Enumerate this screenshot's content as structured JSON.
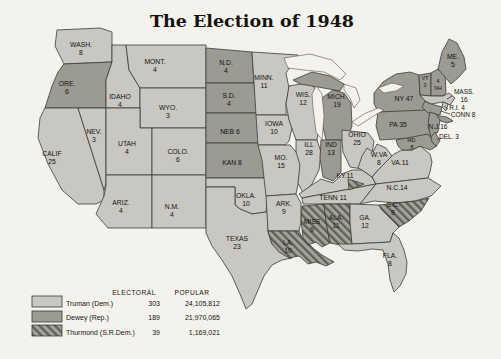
{
  "title": "The Election of 1948",
  "colors": {
    "truman": "#c8c7c1",
    "dewey": "#9b9a93",
    "thurmond_base": "#a3a29b",
    "thurmond_stripe": "#5f5e57",
    "border": "#3c3b35",
    "background": "#f4f2ec",
    "text": "#14130f"
  },
  "legend": {
    "electoral_header": "ELECTORAL",
    "popular_header": "POPULAR",
    "rows": [
      {
        "candidate": "Truman (Dem.)",
        "party": "truman",
        "electoral": "303",
        "popular": "24,105,812"
      },
      {
        "candidate": "Dewey (Rep.)",
        "party": "dewey",
        "electoral": "189",
        "popular": "21,970,065"
      },
      {
        "candidate": "Thurmond (S.R.Dem.)",
        "party": "thurmond",
        "electoral": "39",
        "popular": "1,169,021"
      }
    ]
  },
  "states": [
    {
      "id": "wash",
      "lines": [
        "WASH.",
        "8"
      ],
      "winner": "truman"
    },
    {
      "id": "ore",
      "lines": [
        "ORE.",
        "6"
      ],
      "winner": "dewey"
    },
    {
      "id": "calif",
      "lines": [
        "CALIF",
        "25"
      ],
      "winner": "truman"
    },
    {
      "id": "nev",
      "lines": [
        "NEV.",
        "3"
      ],
      "winner": "truman"
    },
    {
      "id": "idaho",
      "lines": [
        "IDAHO",
        "4"
      ],
      "winner": "truman"
    },
    {
      "id": "mont",
      "lines": [
        "MONT.",
        "4"
      ],
      "winner": "truman"
    },
    {
      "id": "wyo",
      "lines": [
        "WYO.",
        "3"
      ],
      "winner": "truman"
    },
    {
      "id": "utah",
      "lines": [
        "UTAH",
        "4"
      ],
      "winner": "truman"
    },
    {
      "id": "colo",
      "lines": [
        "COLO.",
        "6"
      ],
      "winner": "truman"
    },
    {
      "id": "ariz",
      "lines": [
        "ARIZ.",
        "4"
      ],
      "winner": "truman"
    },
    {
      "id": "nm",
      "lines": [
        "N.M.",
        "4"
      ],
      "winner": "truman"
    },
    {
      "id": "nd",
      "lines": [
        "N.D.",
        "4"
      ],
      "winner": "dewey"
    },
    {
      "id": "sd",
      "lines": [
        "S.D.",
        "4"
      ],
      "winner": "dewey"
    },
    {
      "id": "neb",
      "lines": [
        "NEB 6"
      ],
      "winner": "dewey"
    },
    {
      "id": "kan",
      "lines": [
        "KAN 8"
      ],
      "winner": "dewey"
    },
    {
      "id": "okla",
      "lines": [
        "OKLA.",
        "10"
      ],
      "winner": "truman"
    },
    {
      "id": "texas",
      "lines": [
        "TEXAS",
        "23"
      ],
      "winner": "truman"
    },
    {
      "id": "minn",
      "lines": [
        "MINN.",
        "11"
      ],
      "winner": "truman"
    },
    {
      "id": "iowa",
      "lines": [
        "IOWA",
        "10"
      ],
      "winner": "truman"
    },
    {
      "id": "mo",
      "lines": [
        "MO.",
        "15"
      ],
      "winner": "truman"
    },
    {
      "id": "ark",
      "lines": [
        "ARK.",
        "9"
      ],
      "winner": "truman"
    },
    {
      "id": "la",
      "lines": [
        "LA.",
        "10"
      ],
      "winner": "thurmond"
    },
    {
      "id": "wis",
      "lines": [
        "WIS.",
        "12"
      ],
      "winner": "truman"
    },
    {
      "id": "ill",
      "lines": [
        "ILL",
        "28"
      ],
      "winner": "truman"
    },
    {
      "id": "mich",
      "lines": [
        "MICH.",
        "19"
      ],
      "winner": "dewey"
    },
    {
      "id": "ind",
      "lines": [
        "IND",
        "13"
      ],
      "winner": "dewey"
    },
    {
      "id": "ohio",
      "lines": [
        "OHIO",
        "25"
      ],
      "winner": "truman"
    },
    {
      "id": "ky",
      "lines": [
        "KY.11"
      ],
      "winner": "truman"
    },
    {
      "id": "tenn",
      "lines": [
        "TENN 11"
      ],
      "winner": "truman"
    },
    {
      "id": "miss",
      "lines": [
        "MISS",
        "9"
      ],
      "winner": "thurmond"
    },
    {
      "id": "ala",
      "lines": [
        "ALA.",
        "11"
      ],
      "winner": "thurmond"
    },
    {
      "id": "ga",
      "lines": [
        "GA.",
        "12"
      ],
      "winner": "truman"
    },
    {
      "id": "fla",
      "lines": [
        "FLA.",
        "8"
      ],
      "winner": "truman"
    },
    {
      "id": "wva",
      "lines": [
        "W.VA",
        "8"
      ],
      "winner": "truman"
    },
    {
      "id": "va",
      "lines": [
        "VA.11"
      ],
      "winner": "truman"
    },
    {
      "id": "nc",
      "lines": [
        "N.C.14"
      ],
      "winner": "truman"
    },
    {
      "id": "sc",
      "lines": [
        "S.C.",
        "8"
      ],
      "winner": "thurmond"
    },
    {
      "id": "pa",
      "lines": [
        "PA 35"
      ],
      "winner": "dewey"
    },
    {
      "id": "ny",
      "lines": [
        "NY 47"
      ],
      "winner": "dewey"
    },
    {
      "id": "vt",
      "lines": [
        "VT",
        "3"
      ],
      "winner": "dewey"
    },
    {
      "id": "nh",
      "lines": [
        "4",
        "NH"
      ],
      "winner": "dewey"
    },
    {
      "id": "me",
      "lines": [
        "ME.",
        "5"
      ],
      "winner": "dewey"
    },
    {
      "id": "mass",
      "lines": [
        "MASS.",
        "16"
      ],
      "winner": "truman"
    },
    {
      "id": "ri",
      "lines": [
        "R.I. 4"
      ],
      "winner": "truman"
    },
    {
      "id": "conn",
      "lines": [
        "CONN 8"
      ],
      "winner": "dewey"
    },
    {
      "id": "nj",
      "lines": [
        "N.J.16"
      ],
      "winner": "dewey"
    },
    {
      "id": "md",
      "lines": [
        "MD.",
        "8"
      ],
      "winner": "dewey"
    },
    {
      "id": "del",
      "lines": [
        "DEL. 3"
      ],
      "winner": "dewey"
    },
    {
      "id": "tenn-elector",
      "lines": [],
      "winner": "thurmond"
    }
  ]
}
